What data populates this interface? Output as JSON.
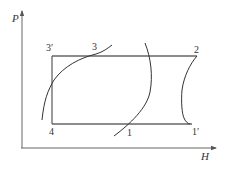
{
  "diagram": {
    "type": "P-H refrigeration cycle diagram",
    "axes": {
      "y_label": "P",
      "x_label": "H"
    },
    "points": [
      {
        "id": "3'",
        "label": "3′"
      },
      {
        "id": "3",
        "label": "3"
      },
      {
        "id": "2",
        "label": "2"
      },
      {
        "id": "4",
        "label": "4"
      },
      {
        "id": "1",
        "label": "1"
      },
      {
        "id": "1'",
        "label": "1′"
      }
    ],
    "curves": [
      {
        "name": "saturated-liquid-curve",
        "passes": [
          "4-region",
          "3"
        ]
      },
      {
        "name": "saturated-vapor-curve",
        "passes": [
          "1"
        ]
      },
      {
        "name": "compression-curve",
        "from": "1'",
        "to": "2"
      }
    ],
    "cycle_path": [
      "3'",
      "3",
      "2",
      "1'",
      "1",
      "4",
      "3'"
    ],
    "colors": {
      "line": "#555555",
      "curve": "#333333",
      "background": "#ffffff"
    }
  }
}
